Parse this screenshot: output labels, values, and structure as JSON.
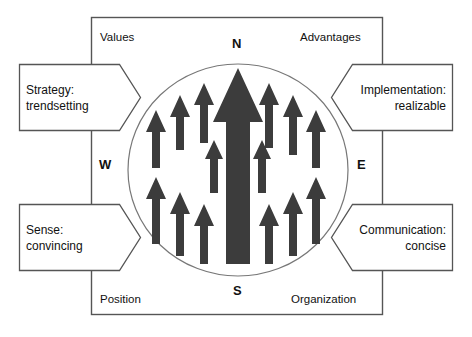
{
  "diagram": {
    "frame": {
      "shape": "rectangle"
    },
    "circle": {
      "shape": "ellipse"
    },
    "colors": {
      "stroke": "#555555",
      "arrow": "#3c3c3c",
      "text": "#111111",
      "background": "#ffffff"
    },
    "compass_labels": [
      {
        "key": "north",
        "label": "N"
      },
      {
        "key": "east",
        "label": "E"
      },
      {
        "key": "south",
        "label": "S"
      },
      {
        "key": "west",
        "label": "W"
      }
    ],
    "corner_labels": [
      {
        "key": "top-left",
        "label": "Values"
      },
      {
        "key": "top-right",
        "label": "Advantages"
      },
      {
        "key": "bottom-left",
        "label": "Position"
      },
      {
        "key": "bottom-right",
        "label": "Organization"
      }
    ],
    "callouts": [
      {
        "key": "strategy",
        "side": "left",
        "position": "top-left",
        "line1": "Strategy:",
        "line2": "trendsetting"
      },
      {
        "key": "implementation",
        "side": "right",
        "position": "top-right",
        "line1": "Implementation:",
        "line2": "realizable"
      },
      {
        "key": "sense",
        "side": "left",
        "position": "bottom-left",
        "line1": "Sense:",
        "line2": "convincing"
      },
      {
        "key": "communication",
        "side": "right",
        "position": "bottom-right",
        "line1": "Communication:",
        "line2": "concise"
      }
    ],
    "arrows": {
      "direction": "up",
      "count": 19,
      "main_arrow": {
        "label": "central large arrow",
        "direction": "up"
      }
    }
  }
}
